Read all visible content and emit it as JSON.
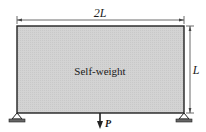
{
  "diagram": {
    "body_label": "Self-weight",
    "width_label": "2L",
    "height_label": "L",
    "load_label": "P",
    "colors": {
      "fill": "#d2d2d2",
      "stroke": "#222222",
      "dim": "#444444"
    },
    "supports": [
      "left-pin-support",
      "right-pin-support"
    ]
  }
}
